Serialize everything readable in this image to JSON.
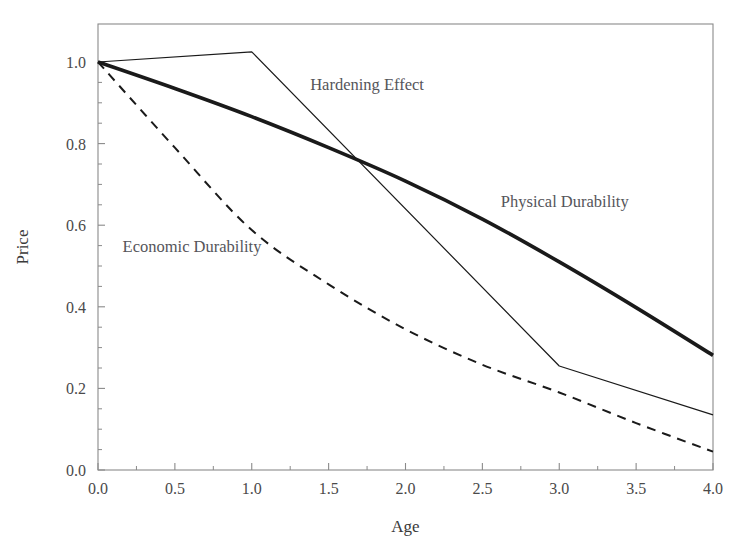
{
  "chart_data": {
    "type": "line",
    "title": "",
    "xlabel": "Age",
    "ylabel": "Price",
    "xlim": [
      0.0,
      4.0
    ],
    "ylim": [
      0.0,
      1.0935
    ],
    "grid": false,
    "legend_position": "inline-annotations",
    "x_ticks": [
      "0.0",
      "0.5",
      "1.0",
      "1.5",
      "2.0",
      "2.5",
      "3.0",
      "3.5",
      "4.0"
    ],
    "x_tick_values": [
      0.0,
      0.5,
      1.0,
      1.5,
      2.0,
      2.5,
      3.0,
      3.5,
      4.0
    ],
    "x_minor_step": 0.25,
    "y_ticks": [
      "0.0",
      "0.2",
      "0.4",
      "0.6",
      "0.8",
      "1.0"
    ],
    "y_tick_values": [
      0.0,
      0.2,
      0.4,
      0.6,
      0.8,
      1.0
    ],
    "y_minor_step": 0.05,
    "series": [
      {
        "name": "Physical Durability",
        "style": "solid-thick",
        "color": "#1a1a1a",
        "width": 3.6,
        "x": [
          0.0,
          0.5,
          1.0,
          1.5,
          2.0,
          2.5,
          3.0,
          3.5,
          4.0
        ],
        "values": [
          1.0,
          0.935,
          0.866,
          0.79,
          0.708,
          0.615,
          0.51,
          0.398,
          0.281
        ],
        "label_x": 2.62,
        "label_y": 0.645
      },
      {
        "name": "Hardening Effect",
        "style": "solid-thin",
        "color": "#1a1a1a",
        "width": 1.2,
        "x": [
          0.0,
          1.0,
          3.0,
          4.0
        ],
        "values": [
          1.0,
          1.025,
          0.255,
          0.135
        ],
        "label_x": 1.38,
        "label_y": 0.932
      },
      {
        "name": "Economic Durability",
        "style": "dashed",
        "color": "#1a1a1a",
        "width": 2.0,
        "x": [
          0.0,
          0.5,
          1.0,
          1.5,
          2.0,
          2.5,
          3.0,
          3.5,
          4.0
        ],
        "values": [
          1.0,
          0.79,
          0.588,
          0.455,
          0.345,
          0.258,
          0.19,
          0.115,
          0.045
        ],
        "label_x": 0.16,
        "label_y": 0.535
      }
    ]
  },
  "axes": {
    "x_title": "Age",
    "y_title": "Price"
  },
  "colors": {
    "frame": "#8a8a8a",
    "line": "#1a1a1a",
    "text": "#4a4a4a"
  }
}
